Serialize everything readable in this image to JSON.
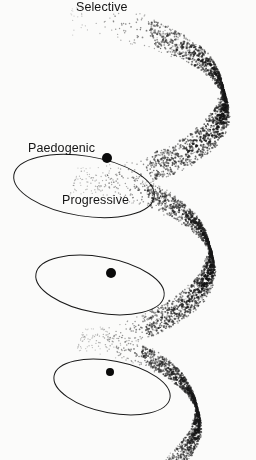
{
  "figure": {
    "width": 256,
    "height": 460,
    "background_color": "#fbfbfa",
    "ink_color": "#1a1a1a",
    "marker_color": "#0a0a0a"
  },
  "labels": [
    {
      "id": "selective",
      "text": "Selective",
      "x": 76,
      "y": 1,
      "anchor": "left"
    },
    {
      "id": "paedogenic",
      "text": "Paedogenic",
      "x": 28,
      "y": 142,
      "anchor": "left"
    },
    {
      "id": "progressive",
      "text": "Progressive",
      "x": 62,
      "y": 194,
      "anchor": "left"
    }
  ],
  "markers": [
    {
      "id": "marker-1",
      "cx": 107,
      "cy": 158,
      "r": 5.2
    },
    {
      "id": "marker-2",
      "cx": 111,
      "cy": 273,
      "r": 5.0
    },
    {
      "id": "marker-3",
      "cx": 110,
      "cy": 372,
      "r": 4.4
    }
  ],
  "loops": [
    {
      "id": "loop-1",
      "cx": 84,
      "cy": 186,
      "rx": 71,
      "ry": 30,
      "tilt": 9,
      "stroke": 1.0
    },
    {
      "id": "loop-2",
      "cx": 100,
      "cy": 285,
      "rx": 65,
      "ry": 28,
      "tilt": 10,
      "stroke": 1.0
    },
    {
      "id": "loop-3",
      "cx": 112,
      "cy": 387,
      "rx": 59,
      "ry": 26,
      "tilt": 11,
      "stroke": 1.0
    }
  ],
  "helix": {
    "description": "Stippled three-turn conical helix shading band, dense on the right limb, fading to sparse at the upper-left start and lower-left tail",
    "turns": 3,
    "start_angle_deg": 175,
    "end_angle_deg": 1140,
    "top": 20,
    "bottom": 446,
    "band_width_top": 34,
    "band_width_bottom": 22,
    "center_x_top": 150,
    "center_x_bottom": 140,
    "radius_x_top": 82,
    "radius_x_bottom": 56,
    "radius_y_top": 30,
    "radius_y_bottom": 24,
    "dot_count": 5200,
    "dot_min_size": 0.55,
    "dot_max_size": 1.45
  }
}
